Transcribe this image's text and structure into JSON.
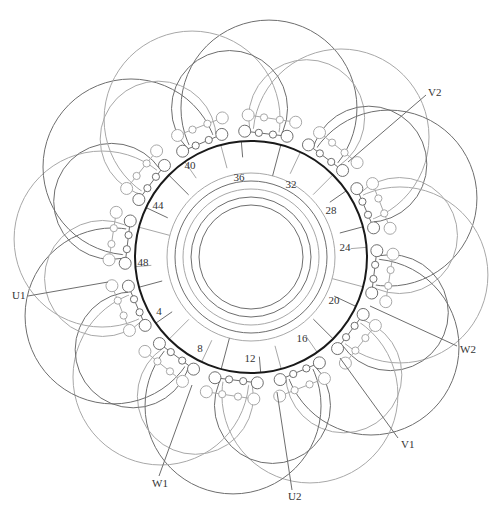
{
  "diagram": {
    "type": "stator-winding-diagram",
    "center": [
      251,
      257
    ],
    "stator_circle_radius": 116,
    "colors": {
      "stator": "#1a1a1a",
      "dark_coil": "#6e6e6e",
      "light_coil": "#a8a8a8",
      "ring": "#8a8a8a",
      "label": "#333333",
      "background": "#ffffff"
    },
    "slot_labels": [
      {
        "text": "36",
        "x": 239,
        "y": 181
      },
      {
        "text": "32",
        "x": 291,
        "y": 188
      },
      {
        "text": "28",
        "x": 331,
        "y": 214
      },
      {
        "text": "24",
        "x": 345,
        "y": 251
      },
      {
        "text": "20",
        "x": 334,
        "y": 304
      },
      {
        "text": "16",
        "x": 302,
        "y": 342
      },
      {
        "text": "12",
        "x": 250,
        "y": 362
      },
      {
        "text": "8",
        "x": 200,
        "y": 352
      },
      {
        "text": "4",
        "x": 159,
        "y": 315
      },
      {
        "text": "48",
        "x": 143,
        "y": 266
      },
      {
        "text": "44",
        "x": 158,
        "y": 209
      },
      {
        "text": "40",
        "x": 190,
        "y": 169
      }
    ],
    "terminals": [
      {
        "id": "U1",
        "text": "U1",
        "label_x": 12,
        "label_y": 299,
        "line": [
          [
            28,
            296
          ],
          [
            108,
            282
          ]
        ]
      },
      {
        "id": "U2",
        "text": "U2",
        "label_x": 288,
        "label_y": 500,
        "line": [
          [
            292,
            490
          ],
          [
            277,
            392
          ]
        ]
      },
      {
        "id": "V1",
        "text": "V1",
        "label_x": 401,
        "label_y": 448,
        "line": [
          [
            398,
            438
          ],
          [
            340,
            358
          ]
        ]
      },
      {
        "id": "V2",
        "text": "V2",
        "label_x": 428,
        "label_y": 96,
        "line": [
          [
            426,
            95
          ],
          [
            348,
            162
          ]
        ]
      },
      {
        "id": "W1",
        "text": "W1",
        "label_x": 152,
        "label_y": 487,
        "line": [
          [
            159,
            476
          ],
          [
            192,
            385
          ]
        ]
      },
      {
        "id": "W2",
        "text": "W2",
        "label_x": 460,
        "label_y": 353,
        "line": [
          [
            457,
            346
          ],
          [
            370,
            306
          ]
        ]
      }
    ],
    "coil_group_count": 12,
    "connection_rings": [
      60,
      68,
      76,
      84
    ]
  }
}
